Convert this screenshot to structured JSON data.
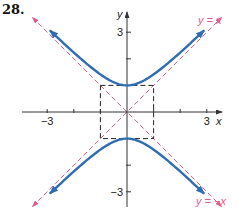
{
  "problem_number": "28.",
  "axes": {
    "x_label": "x",
    "y_label": "y",
    "x_ticks": [
      {
        "value": -3,
        "label": "−3"
      },
      {
        "value": -2,
        "label": ""
      },
      {
        "value": -1,
        "label": ""
      },
      {
        "value": 1,
        "label": ""
      },
      {
        "value": 2,
        "label": ""
      },
      {
        "value": 3,
        "label": "3"
      }
    ],
    "y_ticks": [
      {
        "value": 3,
        "label": "3"
      },
      {
        "value": 2,
        "label": ""
      },
      {
        "value": -2,
        "label": ""
      },
      {
        "value": -3,
        "label": "−3"
      }
    ],
    "x_range": [
      -4.5,
      4.5
    ],
    "y_range": [
      -4.2,
      4.2
    ]
  },
  "asymptotes": [
    {
      "label": "y = x",
      "slope": 1
    },
    {
      "label": "y = −x",
      "slope": -1
    }
  ],
  "reference_box": {
    "x_min": -1,
    "x_max": 1,
    "y_min": -1,
    "y_max": 1
  },
  "curve": {
    "equation": "y^2 - x^2 = 1",
    "type": "hyperbola",
    "vertices": [
      [
        0,
        1
      ],
      [
        0,
        -1
      ]
    ],
    "x_extent": 2.9
  },
  "colors": {
    "curve": "#2e6db5",
    "asymptote": "#e05a8a",
    "axis": "#333333",
    "box": "#222222",
    "label_asymptote": "#e05a8a"
  }
}
